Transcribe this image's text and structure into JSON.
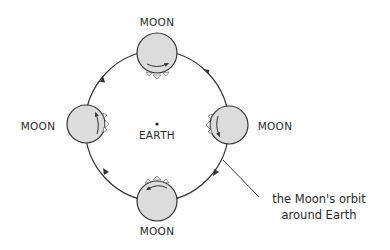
{
  "diagram": {
    "center_label": "EARTH",
    "moons": [
      {
        "position": "top",
        "label": "MOON"
      },
      {
        "position": "left",
        "label": "MOON"
      },
      {
        "position": "right",
        "label": "MOON"
      },
      {
        "position": "bottom",
        "label": "MOON"
      }
    ],
    "annotation": {
      "line1": "the Moon's orbit",
      "line2": "around Earth"
    },
    "orbit_direction": "counterclockwise",
    "colors": {
      "moon_fill": "#dcdcdc",
      "stroke": "#333333",
      "text": "#2a2a2a",
      "background": "#ffffff"
    }
  }
}
